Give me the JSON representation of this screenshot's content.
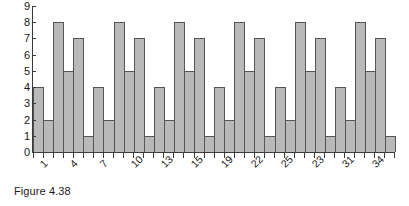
{
  "caption": "Figure 4.38",
  "chart_data": {
    "type": "bar",
    "title": "",
    "subtitle": "",
    "xlabel": "",
    "ylabel": "",
    "ylim": [
      0,
      9
    ],
    "y_ticks": [
      0,
      1,
      2,
      3,
      4,
      5,
      6,
      7,
      8,
      9
    ],
    "grid": false,
    "legend": null,
    "legend_position": "none",
    "x_tick_labels": [
      "1",
      "4",
      "7",
      "10",
      "13",
      "15",
      "19",
      "22",
      "25",
      "23",
      "31",
      "34"
    ],
    "x_tick_positions": [
      0,
      3,
      6,
      9,
      12,
      15,
      18,
      21,
      24,
      27,
      30,
      33
    ],
    "categories": [
      "1",
      "2",
      "3",
      "4",
      "5",
      "6",
      "7",
      "8",
      "9",
      "10",
      "11",
      "12",
      "13",
      "14",
      "15",
      "16",
      "17",
      "18",
      "19",
      "20",
      "21",
      "22",
      "23",
      "24",
      "25",
      "26",
      "27",
      "28",
      "29",
      "30",
      "31",
      "32",
      "33",
      "34",
      "35",
      "36"
    ],
    "values": [
      4,
      2,
      8,
      5,
      7,
      1,
      4,
      2,
      8,
      5,
      7,
      1,
      4,
      2,
      8,
      5,
      7,
      1,
      4,
      2,
      8,
      5,
      7,
      1,
      4,
      2,
      8,
      5,
      7,
      1,
      4,
      2,
      8,
      5,
      7,
      1
    ],
    "repeating_pattern": [
      4,
      2,
      8,
      5,
      7,
      1
    ],
    "pattern_period": 6,
    "bar_count": 36,
    "bar_fill_color": "#b9b9b9",
    "bar_edge_color": "#555555",
    "axis_color": "#3a3a3a",
    "background_color": "#ffffff",
    "text_color": "#171717",
    "x_label_rotation_degrees": -45
  }
}
